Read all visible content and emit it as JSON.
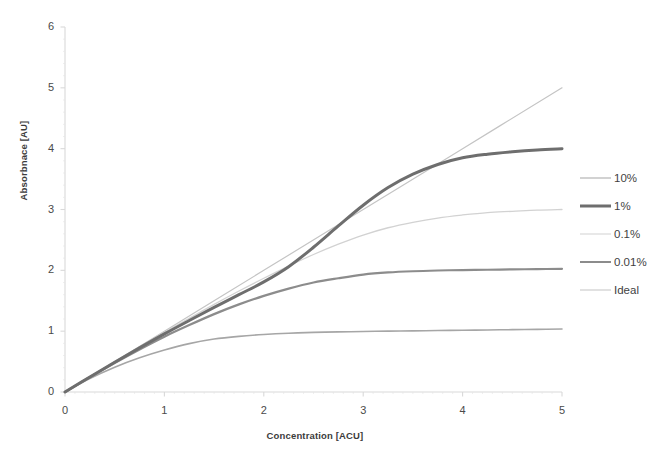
{
  "chart_data": {
    "type": "line",
    "title": "",
    "xlabel": "Concentration [ACU]",
    "ylabel": "Absorbnace [AU]",
    "xlim": [
      0,
      5
    ],
    "ylim": [
      0,
      6
    ],
    "xticks": [
      "0",
      "1",
      "2",
      "3",
      "4",
      "5"
    ],
    "yticks": [
      "0",
      "1",
      "2",
      "3",
      "4",
      "5",
      "6"
    ],
    "grid": false,
    "legend_position": "right",
    "series": [
      {
        "name": "10%",
        "color": "#a6a6a6",
        "width": 1.6,
        "plateau": 1.0,
        "x": [
          0,
          0.25,
          0.5,
          0.75,
          1.0,
          1.25,
          1.5,
          1.75,
          2.0,
          2.25,
          2.5,
          2.75,
          3.0,
          3.25,
          3.5,
          3.75,
          4.0,
          4.25,
          4.5,
          4.75,
          5.0
        ],
        "y": [
          0,
          0.221,
          0.407,
          0.562,
          0.69,
          0.795,
          0.87,
          0.915,
          0.945,
          0.966,
          0.98,
          0.988,
          0.995,
          1.0,
          1.005,
          1.01,
          1.015,
          1.02,
          1.025,
          1.03,
          1.035
        ]
      },
      {
        "name": "1%",
        "color": "#6e6e6e",
        "width": 3.0,
        "plateau": 4.0,
        "x": [
          0,
          0.25,
          0.5,
          0.75,
          1.0,
          1.25,
          1.5,
          1.75,
          2.0,
          2.25,
          2.5,
          2.75,
          3.0,
          3.25,
          3.5,
          3.75,
          4.0,
          4.25,
          4.5,
          4.75,
          5.0
        ],
        "y": [
          0,
          0.248,
          0.49,
          0.725,
          0.955,
          1.175,
          1.39,
          1.6,
          1.81,
          2.06,
          2.38,
          2.73,
          3.07,
          3.36,
          3.58,
          3.74,
          3.85,
          3.91,
          3.95,
          3.98,
          4.0
        ]
      },
      {
        "name": "0.1%",
        "color": "#d2d2d2",
        "width": 1.3,
        "plateau": 3.0,
        "x": [
          0,
          0.25,
          0.5,
          0.75,
          1.0,
          1.25,
          1.5,
          1.75,
          2.0,
          2.25,
          2.5,
          2.75,
          3.0,
          3.25,
          3.5,
          3.75,
          4.0,
          4.25,
          4.5,
          4.75,
          5.0
        ],
        "y": [
          0,
          0.249,
          0.496,
          0.74,
          0.98,
          1.21,
          1.44,
          1.66,
          1.87,
          2.07,
          2.26,
          2.43,
          2.58,
          2.7,
          2.79,
          2.86,
          2.91,
          2.95,
          2.97,
          2.99,
          3.0
        ]
      },
      {
        "name": "0.01%",
        "color": "#8c8c8c",
        "width": 2.2,
        "plateau": 2.0,
        "x": [
          0,
          0.25,
          0.5,
          0.75,
          1.0,
          1.25,
          1.5,
          1.75,
          2.0,
          2.25,
          2.5,
          2.75,
          3.0,
          3.25,
          3.5,
          3.75,
          4.0,
          4.25,
          4.5,
          4.75,
          5.0
        ],
        "y": [
          0,
          0.243,
          0.477,
          0.7,
          0.91,
          1.1,
          1.28,
          1.44,
          1.58,
          1.7,
          1.8,
          1.87,
          1.93,
          1.965,
          1.985,
          1.997,
          2.005,
          2.01,
          2.015,
          2.02,
          2.025
        ]
      },
      {
        "name": "Ideal",
        "color": "#c4c4c4",
        "width": 1.2,
        "plateau": 5.0,
        "x": [
          0,
          1,
          2,
          3,
          4,
          5
        ],
        "y": [
          0,
          1,
          2,
          3,
          4,
          5
        ]
      }
    ]
  },
  "legend": {
    "entries": [
      {
        "label": "10%"
      },
      {
        "label": "1%"
      },
      {
        "label": "0.1%"
      },
      {
        "label": "0.01%"
      },
      {
        "label": "Ideal"
      }
    ]
  },
  "colors": {
    "axis": "#d9d9d9",
    "tick_text": "#4a4a4a",
    "axis_title": "#3c3c3c",
    "background": "#ffffff"
  }
}
